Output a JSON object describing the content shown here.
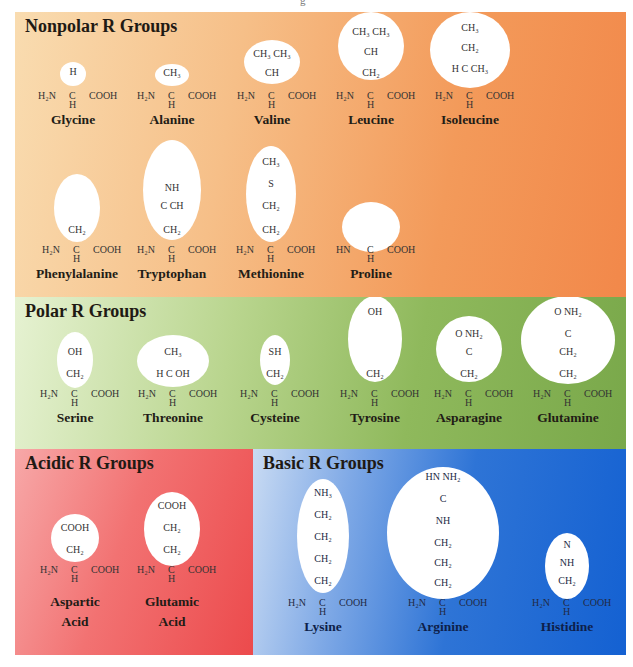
{
  "top_mark": "g",
  "backbone": {
    "amine": "H₂N",
    "alpha_c": "C",
    "alpha_h": "H",
    "carboxyl": "COOH",
    "proline_amine": "HN"
  },
  "panels": {
    "nonpolar": {
      "title": "Nonpolar R Groups",
      "color": "#f39a5a",
      "amino_acids": [
        {
          "name": "Glycine",
          "r_group": [
            "H"
          ]
        },
        {
          "name": "Alanine",
          "r_group": [
            "CH₃"
          ]
        },
        {
          "name": "Valine",
          "r_group": [
            "CH₃  CH₃",
            "CH"
          ]
        },
        {
          "name": "Leucine",
          "r_group": [
            "CH₃  CH₃",
            "CH",
            "CH₂"
          ]
        },
        {
          "name": "Isoleucine",
          "r_group": [
            "CH₃",
            "CH₂",
            "H   C   CH₃"
          ]
        },
        {
          "name": "Phenylalanine",
          "r_group": [
            "CH₂"
          ]
        },
        {
          "name": "Tryptophan",
          "r_group": [
            "NH",
            "C  CH",
            "CH₂"
          ]
        },
        {
          "name": "Methionine",
          "r_group": [
            "CH₃",
            "S",
            "CH₂",
            "CH₂"
          ]
        },
        {
          "name": "Proline",
          "r_group": []
        }
      ]
    },
    "polar": {
      "title": "Polar R Groups",
      "color": "#8fb95c",
      "amino_acids": [
        {
          "name": "Serine",
          "r_group": [
            "OH",
            "CH₂"
          ]
        },
        {
          "name": "Threonine",
          "r_group": [
            "CH₃",
            "H   C   OH"
          ]
        },
        {
          "name": "Cysteine",
          "r_group": [
            "SH",
            "CH₂"
          ]
        },
        {
          "name": "Tyrosine",
          "r_group": [
            "OH",
            "CH₂"
          ]
        },
        {
          "name": "Asparagine",
          "r_group": [
            "O    NH₂",
            "C",
            "CH₂"
          ]
        },
        {
          "name": "Glutamine",
          "r_group": [
            "O    NH₂",
            "C",
            "CH₂",
            "CH₂"
          ]
        }
      ]
    },
    "acidic": {
      "title": "Acidic R Groups",
      "color": "#ec4a4c",
      "amino_acids": [
        {
          "name": "Aspartic Acid",
          "name_lines": [
            "Aspartic",
            "Acid"
          ],
          "r_group": [
            "COOH",
            "CH₂"
          ]
        },
        {
          "name": "Glutamic Acid",
          "name_lines": [
            "Glutamic",
            "Acid"
          ],
          "r_group": [
            "COOH",
            "CH₂",
            "CH₂"
          ]
        }
      ]
    },
    "basic": {
      "title": "Basic R Groups",
      "color": "#1461d2",
      "amino_acids": [
        {
          "name": "Lysine",
          "r_group": [
            "NH₃",
            "CH₂",
            "CH₂",
            "CH₂",
            "CH₂"
          ]
        },
        {
          "name": "Arginine",
          "r_group": [
            "HN    NH₂",
            "C",
            "NH",
            "CH₂",
            "CH₂",
            "CH₂"
          ]
        },
        {
          "name": "Histidine",
          "r_group": [
            "N",
            "NH",
            "CH₂"
          ]
        }
      ]
    }
  }
}
